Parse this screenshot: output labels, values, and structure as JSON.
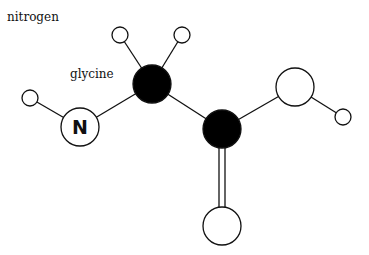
{
  "labels": {
    "nitrogen": "nitrogen",
    "glycine": "glycine",
    "n_symbol": "N"
  },
  "diagram": {
    "atoms": [
      {
        "id": "H1",
        "element": "hydrogen",
        "x": 30,
        "y": 98,
        "r": 8,
        "fill": "#ffffff"
      },
      {
        "id": "N",
        "element": "nitrogen",
        "x": 80,
        "y": 127,
        "r": 19,
        "fill": "#ffffff",
        "label": "N"
      },
      {
        "id": "C1",
        "element": "carbon",
        "x": 152,
        "y": 84,
        "r": 19,
        "fill": "#000000"
      },
      {
        "id": "H2",
        "element": "hydrogen",
        "x": 120,
        "y": 35,
        "r": 8,
        "fill": "#ffffff"
      },
      {
        "id": "H3",
        "element": "hydrogen",
        "x": 182,
        "y": 35,
        "r": 8,
        "fill": "#ffffff"
      },
      {
        "id": "C2",
        "element": "carbon",
        "x": 222,
        "y": 129,
        "r": 19,
        "fill": "#000000"
      },
      {
        "id": "O1",
        "element": "oxygen",
        "x": 295,
        "y": 87,
        "r": 19,
        "fill": "#ffffff"
      },
      {
        "id": "H4",
        "element": "hydrogen",
        "x": 343,
        "y": 117,
        "r": 8,
        "fill": "#ffffff"
      },
      {
        "id": "O2",
        "element": "oxygen",
        "x": 222,
        "y": 226,
        "r": 19,
        "fill": "#ffffff"
      }
    ],
    "bonds": [
      {
        "from": "H1",
        "to": "N",
        "order": 1
      },
      {
        "from": "N",
        "to": "C1",
        "order": 1
      },
      {
        "from": "C1",
        "to": "H2",
        "order": 1
      },
      {
        "from": "C1",
        "to": "H3",
        "order": 1
      },
      {
        "from": "C1",
        "to": "C2",
        "order": 1
      },
      {
        "from": "C2",
        "to": "O1",
        "order": 1
      },
      {
        "from": "O1",
        "to": "H4",
        "order": 1
      },
      {
        "from": "C2",
        "to": "O2",
        "order": 2
      }
    ]
  }
}
